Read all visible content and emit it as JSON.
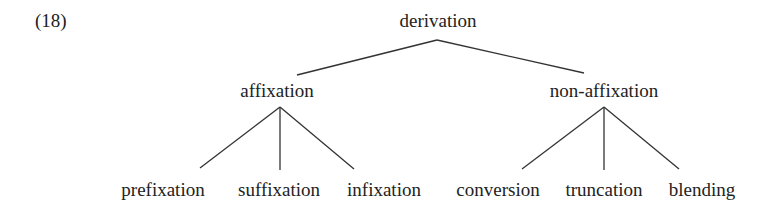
{
  "example_number": "(18)",
  "tree": {
    "root": "derivation",
    "branches": [
      {
        "label": "affixation",
        "children": [
          "prefixation",
          "suffixation",
          "infixation"
        ]
      },
      {
        "label": "non-affixation",
        "children": [
          "conversion",
          "truncation",
          "blending"
        ]
      }
    ]
  },
  "line_color": "#333333"
}
